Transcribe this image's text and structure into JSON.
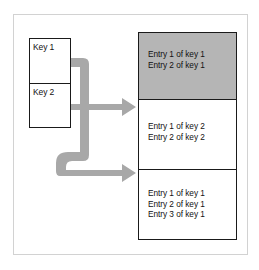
{
  "diagram": {
    "type": "block-diagram",
    "colors": {
      "arrow_fill": "#a8a8a8",
      "highlight_block": "#b5b5b5",
      "box_border": "#1a1a1a",
      "frame_border": "#d2d2d2",
      "background": "#ffffff",
      "text": "#111111"
    },
    "key_table": {
      "cells": [
        {
          "label": "Key 1"
        },
        {
          "label": "Key 2"
        }
      ]
    },
    "entries_table": {
      "blocks": [
        {
          "shaded": "true",
          "lines": [
            "Entry 1 of key 1",
            "Entry 2 of key 1"
          ]
        },
        {
          "shaded": "false",
          "lines": [
            "Entry 1 of key 2",
            "Entry 2 of key 2"
          ]
        },
        {
          "shaded": "false",
          "lines": [
            "Entry 1 of key 1",
            "Entry 2 of key 1",
            "Entry 3 of key 1"
          ]
        }
      ]
    },
    "connectors": [
      {
        "name": "key1-to-block3",
        "shape": "elbow-down-right",
        "from": "Key 1",
        "to": "Entry block 3"
      },
      {
        "name": "key2-to-block2",
        "shape": "straight-right",
        "from": "Key 2",
        "to": "Entry block 2"
      }
    ]
  }
}
